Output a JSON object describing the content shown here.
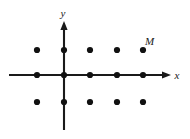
{
  "figure": {
    "background_color": "#ffffff",
    "ink_color": "#1a1a1a",
    "dot_color": "#111111",
    "width": 190,
    "height": 139
  },
  "axes": {
    "x_axis": {
      "label": "x",
      "label_x": 177,
      "label_y": 79,
      "line_x1": 9,
      "line_x2": 163,
      "line_y": 75,
      "arrow_tip_x": 171,
      "arrow_half_height": 3.6,
      "arrow_length": 9
    },
    "y_axis": {
      "label": "y",
      "label_x": 63,
      "label_y": 17,
      "line_x": 64,
      "line_y1": 30,
      "line_y2": 130,
      "arrow_tip_y": 21,
      "arrow_half_width": 3.6,
      "arrow_length": 9
    }
  },
  "grid": {
    "columns_x": [
      37,
      64,
      90,
      117,
      143
    ],
    "rows_y": [
      50,
      75,
      102
    ],
    "dot_radius": 3.1,
    "point_count": 15,
    "points": [
      {
        "cx": 37,
        "cy": 50
      },
      {
        "cx": 64,
        "cy": 50
      },
      {
        "cx": 90,
        "cy": 50
      },
      {
        "cx": 117,
        "cy": 50
      },
      {
        "cx": 143,
        "cy": 50
      },
      {
        "cx": 37,
        "cy": 75
      },
      {
        "cx": 64,
        "cy": 75
      },
      {
        "cx": 90,
        "cy": 75
      },
      {
        "cx": 117,
        "cy": 75
      },
      {
        "cx": 143,
        "cy": 75
      },
      {
        "cx": 37,
        "cy": 102
      },
      {
        "cx": 64,
        "cy": 102
      },
      {
        "cx": 90,
        "cy": 102
      },
      {
        "cx": 117,
        "cy": 102
      },
      {
        "cx": 143,
        "cy": 102
      }
    ]
  },
  "labels": {
    "point_m": {
      "text": "M",
      "x": 145,
      "y": 45,
      "marks_point": {
        "cx": 143,
        "cy": 50
      }
    }
  }
}
